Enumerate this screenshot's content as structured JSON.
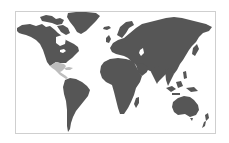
{
  "map": {
    "type": "world-choropleth",
    "projection": "equirectangular-like",
    "colors": {
      "background": "#ffffff",
      "frame_border": "#cfcfcf",
      "land": "#565656",
      "highlight": "#bdbdbd"
    },
    "regions": [
      {
        "name": "North America",
        "state": "default"
      },
      {
        "name": "Greenland",
        "state": "default"
      },
      {
        "name": "Mexico / Central America",
        "state": "highlighted"
      },
      {
        "name": "South America",
        "state": "default"
      },
      {
        "name": "Europe",
        "state": "default"
      },
      {
        "name": "Asia",
        "state": "default"
      },
      {
        "name": "Africa",
        "state": "default"
      },
      {
        "name": "Madagascar",
        "state": "default"
      },
      {
        "name": "Australia",
        "state": "default"
      },
      {
        "name": "New Zealand",
        "state": "default"
      },
      {
        "name": "Southeast Asia Islands",
        "state": "default"
      },
      {
        "name": "Japan",
        "state": "default"
      },
      {
        "name": "United Kingdom",
        "state": "default"
      }
    ],
    "highlighted_region": "Mexico / Central America"
  }
}
